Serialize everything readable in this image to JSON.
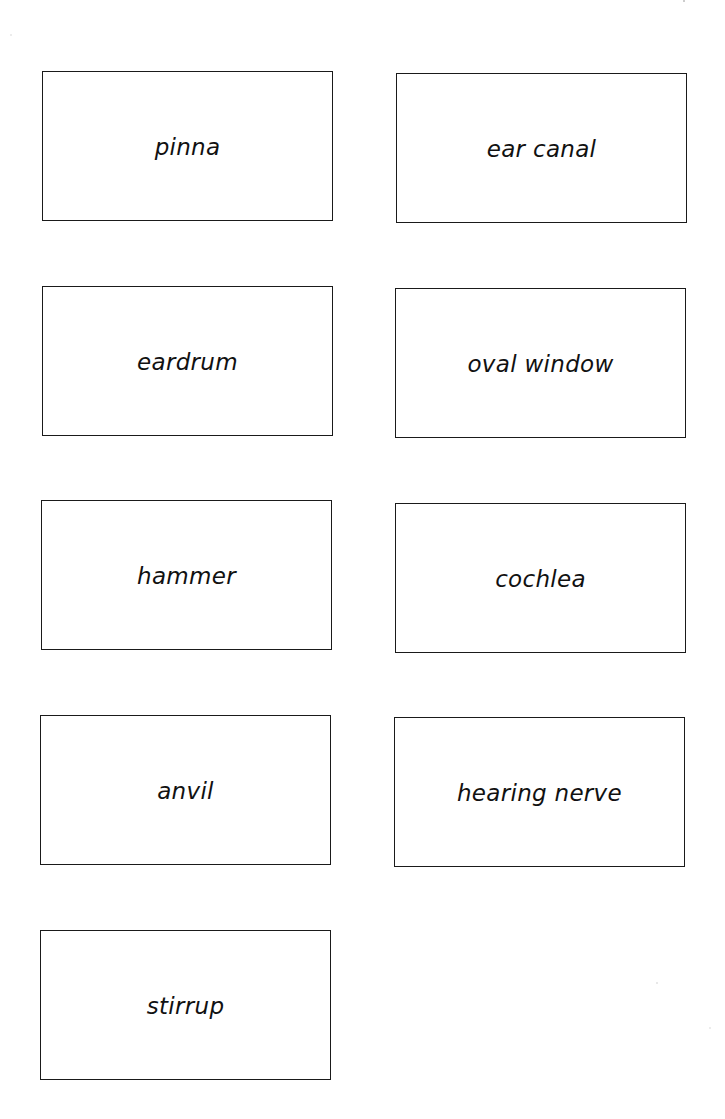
{
  "cards": [
    {
      "label": "pinna",
      "x": 42,
      "y": 71
    },
    {
      "label": "ear canal",
      "x": 396,
      "y": 73
    },
    {
      "label": "eardrum",
      "x": 42,
      "y": 286
    },
    {
      "label": "oval window",
      "x": 395,
      "y": 288
    },
    {
      "label": "hammer",
      "x": 41,
      "y": 500
    },
    {
      "label": "cochlea",
      "x": 395,
      "y": 503
    },
    {
      "label": "anvil",
      "x": 40,
      "y": 715
    },
    {
      "label": "hearing nerve",
      "x": 394,
      "y": 717
    },
    {
      "label": "stirrup",
      "x": 40,
      "y": 930
    }
  ],
  "colors": {
    "border": "#1a1a1a",
    "text": "#111111",
    "background": "#ffffff"
  }
}
